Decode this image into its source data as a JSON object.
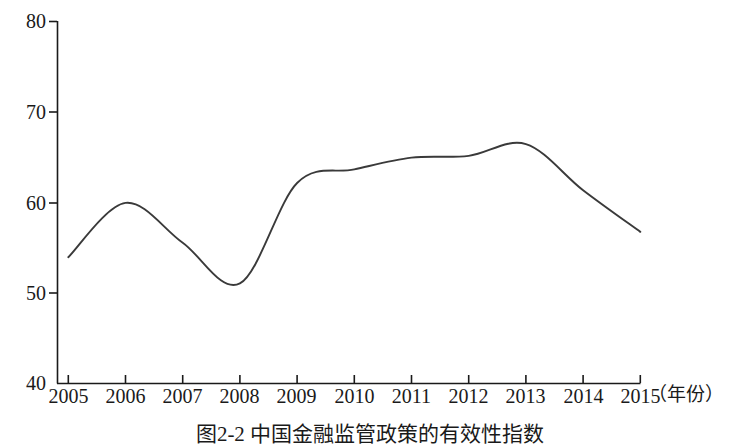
{
  "chart_data": {
    "type": "line",
    "title": "图2-2 中国金融监管政策的有效性指数",
    "xlabel": "（年份）",
    "ylabel": "",
    "x": [
      2005,
      2006,
      2007,
      2008,
      2009,
      2010,
      2011,
      2012,
      2013,
      2014,
      2015
    ],
    "categories": [
      "2005",
      "2006",
      "2007",
      "2008",
      "2009",
      "2010",
      "2011",
      "2012",
      "2013",
      "2014",
      "2015"
    ],
    "values": [
      53.9,
      59.9,
      55.5,
      51.0,
      62.1,
      63.6,
      64.9,
      65.1,
      66.4,
      61.3,
      56.7
    ],
    "series": [
      {
        "name": "中国金融监管政策的有效性指数",
        "values": [
          53.9,
          59.9,
          55.5,
          51.0,
          62.1,
          63.6,
          64.9,
          65.1,
          66.4,
          61.3,
          56.7
        ]
      }
    ],
    "xlim": [
      2005,
      2015
    ],
    "ylim": [
      40,
      80
    ],
    "yticks": [
      40,
      50,
      60,
      70,
      80
    ],
    "ytick_labels": [
      "40",
      "50",
      "60",
      "70",
      "80"
    ],
    "xticks": [
      2005,
      2006,
      2007,
      2008,
      2009,
      2010,
      2011,
      2012,
      2013,
      2014,
      2015
    ],
    "xtick_labels": [
      "2005",
      "2006",
      "2007",
      "2008",
      "2009",
      "2010",
      "2011",
      "2012",
      "2013",
      "2014",
      "2015"
    ],
    "grid": false,
    "legend": false,
    "legend_position": "none",
    "line_color": "#3a3a3a",
    "axis_color": "#1a1a1a",
    "background_color": "#ffffff",
    "smoothing": "spline"
  },
  "caption": {
    "text": "图2-2  中国金融监管政策的有效性指数"
  },
  "axis": {
    "x_title": "（年份）"
  }
}
